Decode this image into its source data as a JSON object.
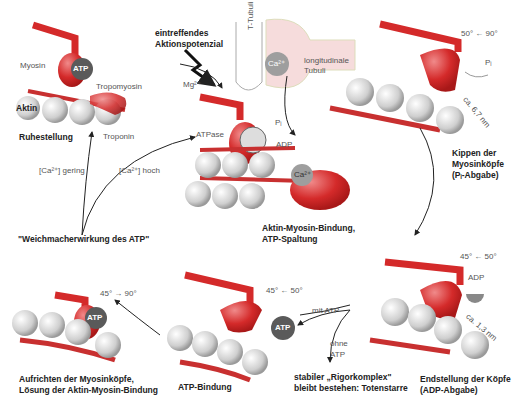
{
  "colors": {
    "myosin": "#d42a2a",
    "actin": "#c8c8c8",
    "atp": "#5a5a5a",
    "tubuli": "#f6dcdc",
    "arrow": "#222222"
  },
  "labels": {
    "myosin": "Myosin",
    "atp": "ATP",
    "tropomyosin": "Tropomyosin",
    "aktin": "Aktin",
    "troponin": "Troponin",
    "ruhestellung": "Ruhestellung",
    "mg": "Mg²⁺",
    "aktionspotenzial_1": "eintreffendes",
    "aktionspotenzial_2": "Aktionspotenzial",
    "t_tubuli": "T-Tubuli",
    "ca": "Ca²⁺",
    "longitudinal_1": "longitudinale",
    "longitudinal_2": "Tubuli",
    "atpase": "ATPase",
    "pi": "Pᵢ",
    "adp": "ADP",
    "ca_gering": "[Ca²⁺] gering",
    "ca_hoch": "[Ca²⁺] hoch",
    "bindung_1": "Aktin-Myosin-Bindung,",
    "bindung_2": "ATP-Spaltung",
    "weichmacher": "\"Weichmacherwirkung des ATP\"",
    "angle_tr": "50° ← 90°",
    "dist_tr": "ca. 6,7 nm",
    "kippen_1": "Kippen der",
    "kippen_2": "Myosinköpfe",
    "kippen_3": "(Pᵢ-Abgabe)",
    "angle_br": "45° ← 50°",
    "dist_br": "ca. 1,3 nm",
    "end_1": "Endstellung der Köpfe",
    "end_2": "(ADP-Abgabe)",
    "angle_bm": "45° ← 50°",
    "mit_atp": "mit ATP",
    "ohne_atp_1": "ohne",
    "ohne_atp_2": "ATP",
    "rigor_1": "stabiler „Rigorkomplex\"",
    "rigor_2": "bleibt bestehen: Totenstarre",
    "atp_bindung": "ATP-Bindung",
    "angle_bl": "45° → 90°",
    "aufrichten_1": "Aufrichten der Myosinköpfe,",
    "aufrichten_2": "Lösung der Aktin-Myosin-Bindung"
  }
}
